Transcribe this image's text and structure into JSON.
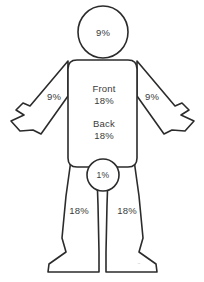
{
  "diagram": {
    "stroke_color": "#2b2b2b",
    "fill_color": "#ffffff",
    "text_color": "#3a3a3a"
  },
  "regions": {
    "head": {
      "name": "head",
      "label": "9%"
    },
    "left_arm": {
      "name": "left-arm",
      "label": "9%"
    },
    "right_arm": {
      "name": "right-arm",
      "label": "9%"
    },
    "torso_front": {
      "name": "torso-front",
      "title": "Front",
      "label": "18%"
    },
    "torso_back": {
      "name": "torso-back",
      "title": "Back",
      "label": "18%"
    },
    "groin": {
      "name": "groin",
      "label": "1%"
    },
    "left_leg": {
      "name": "left-leg",
      "label": "18%"
    },
    "right_leg": {
      "name": "right-leg",
      "label": "18%"
    }
  },
  "watermark": {
    "mark": "~"
  }
}
